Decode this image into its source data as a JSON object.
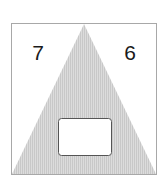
{
  "puzzle": {
    "left_number": "7",
    "right_number": "6",
    "answer_box": ""
  },
  "colors": {
    "frame": "#a8a8a8",
    "triangle_fill": "#dcdcdc",
    "triangle_hatch": "#c8c8c8",
    "text": "#1a1a1a",
    "answer_box_fill": "#ffffff",
    "answer_box_stroke": "#555555"
  }
}
